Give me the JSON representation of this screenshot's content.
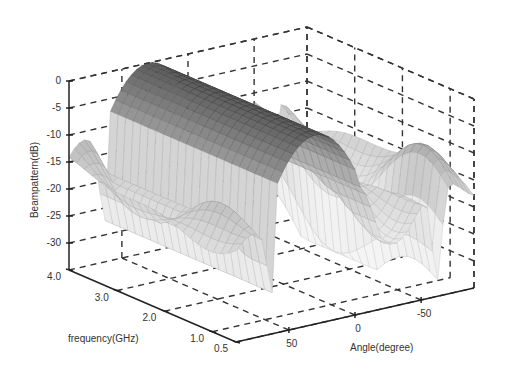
{
  "chart_data": {
    "type": "surface3d",
    "title": "",
    "xlabel": "Angle(degree)",
    "ylabel": "frequency(GHz)",
    "zlabel": "Beampattern(dB)",
    "x_ticks": [
      "50",
      "0",
      "-50"
    ],
    "x_tick_values": [
      50,
      0,
      -50
    ],
    "y_ticks": [
      "0.5",
      "1.0",
      "2.0",
      "3.0",
      "4.0"
    ],
    "y_tick_values": [
      0.5,
      1.0,
      2.0,
      3.0,
      4.0
    ],
    "z_ticks": [
      "0",
      "-5",
      "-10",
      "-15",
      "-20",
      "-25",
      "-30"
    ],
    "z_tick_values": [
      0,
      -5,
      -10,
      -15,
      -20,
      -25,
      -30
    ],
    "xlim": [
      90,
      -90
    ],
    "ylim": [
      0.5,
      4.0
    ],
    "zlim": [
      -35,
      0
    ],
    "grid": true,
    "main_beam_angle": 30,
    "main_beam_level_db": 0,
    "sidelobe_level_db": -15,
    "null_level_db": -35
  }
}
